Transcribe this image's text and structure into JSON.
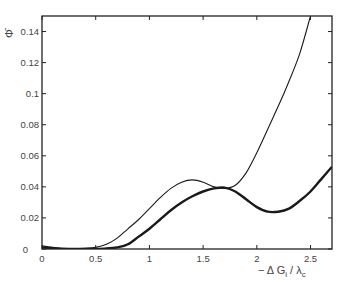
{
  "chart_data": {
    "type": "line",
    "title": "",
    "xlabel": "− Δ G",
    "xlabel_sub1": "i",
    "xlabel_mid": " / λ",
    "xlabel_sub2": "c",
    "ylabel": "Φ̄",
    "xlim": [
      0,
      2.7
    ],
    "ylim": [
      0,
      0.15
    ],
    "grid": false,
    "legend": null,
    "x_ticks": [
      0,
      0.5,
      1,
      1.5,
      2,
      2.5
    ],
    "x_tick_labels": [
      "0",
      "0.5",
      "1",
      "1.5",
      "2",
      "2.5"
    ],
    "y_ticks": [
      0,
      0.02,
      0.04,
      0.06,
      0.08,
      0.1,
      0.12,
      0.14
    ],
    "y_tick_labels": [
      "0",
      "0.02",
      "0.04",
      "0.06",
      "0.08",
      "0.1",
      "0.12",
      "0.14"
    ],
    "series": [
      {
        "name": "thin curve",
        "style": "thin",
        "x": [
          0,
          0.1,
          0.2,
          0.3,
          0.4,
          0.5,
          0.6,
          0.7,
          0.8,
          0.9,
          1.0,
          1.1,
          1.2,
          1.3,
          1.4,
          1.5,
          1.6,
          1.7,
          1.8,
          1.9,
          2.0,
          2.1,
          2.2,
          2.3,
          2.4,
          2.5
        ],
        "values": [
          0.002,
          0.001,
          0.0005,
          0.0003,
          0.0005,
          0.001,
          0.003,
          0.007,
          0.013,
          0.019,
          0.026,
          0.033,
          0.039,
          0.043,
          0.0445,
          0.043,
          0.04,
          0.039,
          0.041,
          0.049,
          0.062,
          0.077,
          0.092,
          0.108,
          0.126,
          0.15
        ]
      },
      {
        "name": "thick curve",
        "style": "thick",
        "x": [
          0,
          0.1,
          0.2,
          0.3,
          0.4,
          0.5,
          0.6,
          0.7,
          0.8,
          0.9,
          1.0,
          1.1,
          1.2,
          1.3,
          1.4,
          1.5,
          1.6,
          1.7,
          1.8,
          1.9,
          2.0,
          2.1,
          2.2,
          2.3,
          2.4,
          2.5,
          2.6,
          2.7
        ],
        "values": [
          0.001,
          0.0005,
          0.0,
          0.0,
          0.0,
          0.0,
          0.0003,
          0.001,
          0.003,
          0.008,
          0.013,
          0.019,
          0.025,
          0.03,
          0.034,
          0.037,
          0.039,
          0.0395,
          0.037,
          0.032,
          0.027,
          0.024,
          0.024,
          0.026,
          0.031,
          0.037,
          0.045,
          0.053
        ]
      }
    ]
  },
  "colors": {
    "line": "#1a1a1a",
    "frame": "#222222",
    "text": "#444444"
  }
}
